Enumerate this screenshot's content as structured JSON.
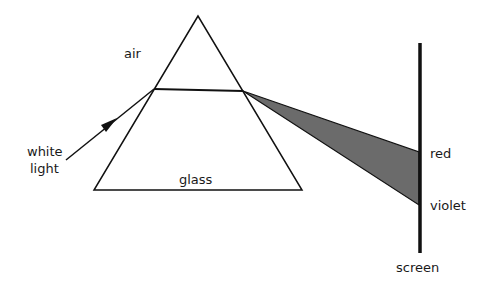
{
  "diagram": {
    "labels": {
      "air": "air",
      "glass": "glass",
      "white_light_line1": "white",
      "white_light_line2": "light",
      "red": "red",
      "violet": "violet",
      "screen": "screen"
    },
    "colors": {
      "line": "#111111",
      "spectrum_fill": "#6b6b6b",
      "background": "#ffffff"
    },
    "geometry": {
      "prism": {
        "apex": [
          198,
          16
        ],
        "base_left": [
          94,
          190
        ],
        "base_right": [
          302,
          190
        ]
      },
      "incident_ray": {
        "from": [
          66,
          160
        ],
        "to": [
          154,
          89
        ]
      },
      "refracted_ray": {
        "from": [
          154,
          89
        ],
        "to": [
          243,
          91
        ]
      },
      "spectrum": {
        "origin": [
          243,
          91
        ],
        "red": [
          419,
          152
        ],
        "violet": [
          419,
          205
        ]
      },
      "screen": {
        "x": 420,
        "y_top": 43,
        "y_bottom": 253
      }
    }
  }
}
